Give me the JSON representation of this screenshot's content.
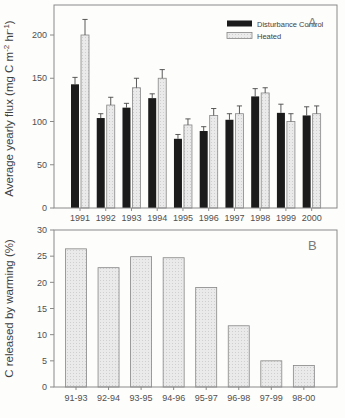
{
  "colors": {
    "control_fill": "#1b1b1b",
    "heated_fill": "#eaeaea",
    "heated_dot": "#cfcfcf",
    "heated_stroke": "#868686",
    "frame": "#8a8a8a",
    "tick_text": "#4f4f4f",
    "label_text": "#3f3f3f",
    "panel_letter": "#7a7a7a",
    "error_bar": "#474747"
  },
  "chart_data": [
    {
      "type": "bar",
      "panel_label": "A",
      "title": "",
      "categories": [
        "1991",
        "1992",
        "1993",
        "1994",
        "1995",
        "1996",
        "1997",
        "1998",
        "1999",
        "2000"
      ],
      "series": [
        {
          "name": "Disturbance Control",
          "style": "solid-black",
          "values": [
            143,
            104,
            116,
            127,
            80,
            89,
            102,
            129,
            110,
            107
          ],
          "errors": [
            8,
            5,
            5,
            5,
            5,
            5,
            7,
            9,
            10,
            10
          ]
        },
        {
          "name": "Heated",
          "style": "stippled-light",
          "values": [
            200,
            119,
            139,
            150,
            96,
            107,
            109,
            133,
            100,
            109
          ],
          "errors": [
            18,
            9,
            11,
            10,
            7,
            8,
            9,
            6,
            9,
            9
          ]
        }
      ],
      "xlabel": "",
      "ylabel": "Average yearly flux (mg C m-2 hr-1)",
      "ylabel_parts": [
        {
          "t": "Average yearly flux (mg C m"
        },
        {
          "t": "-2",
          "sup": true
        },
        {
          "t": " hr"
        },
        {
          "t": "-1",
          "sup": true
        },
        {
          "t": ")"
        }
      ],
      "yticks": [
        0,
        50,
        100,
        150,
        200
      ],
      "ylim": [
        0,
        235
      ],
      "grid": false,
      "legend_position": "top-right-inside",
      "error_bars": "upper-with-caps"
    },
    {
      "type": "bar",
      "panel_label": "B",
      "title": "",
      "categories": [
        "91-93",
        "92-94",
        "93-95",
        "94-96",
        "95-97",
        "96-98",
        "97-99",
        "98-00"
      ],
      "values": [
        26.4,
        22.8,
        24.9,
        24.7,
        19.0,
        11.7,
        5.0,
        4.1
      ],
      "bar_style": "stippled-light",
      "xlabel": "",
      "ylabel": "C released by warming (%)",
      "ylabel_parts": [
        {
          "t": "C released by warming (%)"
        }
      ],
      "yticks": [
        0,
        5,
        10,
        15,
        20,
        25,
        30
      ],
      "ylim": [
        0,
        30
      ],
      "grid": false,
      "legend_position": "none"
    }
  ]
}
